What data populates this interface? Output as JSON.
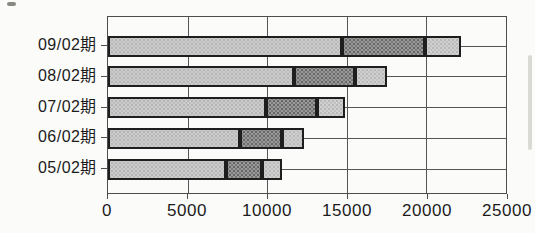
{
  "chart_data": {
    "type": "bar",
    "orientation": "horizontal",
    "stacked": true,
    "title": "",
    "xlabel": "",
    "ylabel": "",
    "categories": [
      "09/02期",
      "08/02期",
      "07/02期",
      "06/02期",
      "05/02期"
    ],
    "series": [
      {
        "name": "segment-1-light",
        "values": [
          14700,
          11700,
          9900,
          8300,
          7400
        ]
      },
      {
        "name": "segment-2-dark",
        "values": [
          5200,
          3800,
          3200,
          2600,
          2300
        ]
      },
      {
        "name": "segment-3-light",
        "values": [
          2300,
          2000,
          1800,
          1400,
          1200
        ]
      }
    ],
    "totals": [
      22200,
      17500,
      14900,
      12300,
      10900
    ],
    "xlim": [
      0,
      25000
    ],
    "x_ticks": [
      0,
      5000,
      10000,
      15000,
      20000,
      25000
    ],
    "x_tick_labels": [
      "0",
      "5000",
      "10000",
      "15000",
      "20000",
      "25000"
    ],
    "grid": true,
    "legend": "none"
  },
  "style": {
    "series_fill_colors": [
      "#cccccc",
      "#999999",
      "#d0d0d0"
    ],
    "bar_border_color": "#1e1e1e",
    "grid_color": "#555555",
    "axis_color": "#4d4d4d",
    "text_color": "#1c1c1c",
    "background": "#fbfbf9"
  }
}
